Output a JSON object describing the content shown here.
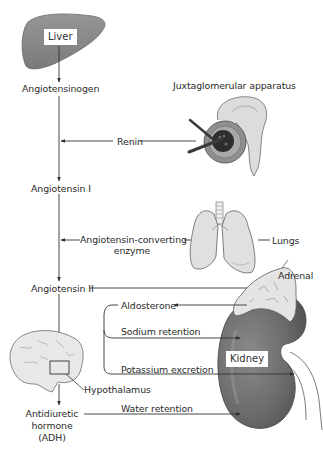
{
  "diagram": {
    "type": "flowchart",
    "organs": {
      "liver": "Liver",
      "juxtaglomerular": "Juxtaglomerular apparatus",
      "lungs": "Lungs",
      "adrenal": "Adrenal",
      "kidney": "Kidney",
      "hypothalamus": "Hypothalamus"
    },
    "nodes": {
      "angiotensinogen": "Angiotensinogen",
      "angiotensin1": "Angiotensin I",
      "angiotensin2": "Angiotensin II",
      "adh_line1": "Antidiuretic",
      "adh_line2": "hormone",
      "adh_line3": "(ADH)"
    },
    "enzymes": {
      "renin": "Renin",
      "ace_line1": "Angiotensin-converting",
      "ace_line2": "enzyme"
    },
    "effects": {
      "aldosterone": "Aldosterone",
      "sodium": "Sodium retention",
      "potassium": "Potassium excretion",
      "water": "Water retention"
    },
    "edges": [
      {
        "from": "Liver",
        "to": "Angiotensinogen"
      },
      {
        "from": "Angiotensinogen",
        "to": "Angiotensin I",
        "via": "Renin"
      },
      {
        "from": "Juxtaglomerular apparatus",
        "to": "Renin"
      },
      {
        "from": "Angiotensin I",
        "to": "Angiotensin II",
        "via": "Angiotensin-converting enzyme"
      },
      {
        "from": "Lungs",
        "to": "Angiotensin-converting enzyme"
      },
      {
        "from": "Angiotensin II",
        "to": "Adrenal"
      },
      {
        "from": "Adrenal",
        "to": "Aldosterone"
      },
      {
        "from": "Aldosterone",
        "to": "Kidney",
        "effect": "Sodium retention"
      },
      {
        "from": "Aldosterone",
        "to": "Kidney",
        "effect": "Potassium excretion"
      },
      {
        "from": "Angiotensin II",
        "to": "Hypothalamus"
      },
      {
        "from": "Hypothalamus",
        "to": "Antidiuretic hormone (ADH)"
      },
      {
        "from": "Antidiuretic hormone (ADH)",
        "to": "Kidney",
        "effect": "Water retention"
      }
    ],
    "colors": {
      "line": "#3a3a3a",
      "liver": "#8a8a8a",
      "kidney": "#6f6f6f",
      "light_organ": "#e2e2e2",
      "organ_stroke": "#5a5a5a"
    }
  }
}
